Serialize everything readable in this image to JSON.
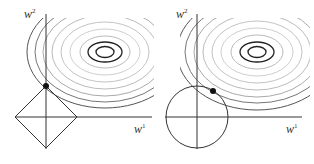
{
  "figure": {
    "panels": [
      {
        "name": "l1-panel",
        "constraint": "diamond",
        "x_axis_label": "w",
        "x_axis_sup": "1",
        "y_axis_label": "w",
        "y_axis_sup": "2"
      },
      {
        "name": "l2-panel",
        "constraint": "circle",
        "x_axis_label": "w",
        "x_axis_sup": "1",
        "y_axis_label": "w",
        "y_axis_sup": "2"
      }
    ],
    "colors": {
      "axis": "#333333",
      "dark_contour": "#222222",
      "light_contour": "#bdbdbd",
      "mid_contour": "#7a7a7a",
      "dot": "#111111"
    }
  }
}
